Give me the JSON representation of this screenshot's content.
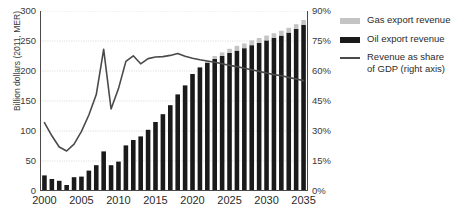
{
  "chart_data": {
    "type": "bar",
    "title": "",
    "subtitle": "",
    "xlabel": "",
    "ylabel": "Billion dollars (2011, MER)",
    "y2label": "",
    "grid": true,
    "legend_position": "right",
    "xlim": [
      1999.4,
      2035.6
    ],
    "ylim": [
      0,
      300
    ],
    "y2lim": [
      0,
      90
    ],
    "ytick_labels": [
      "300",
      "250",
      "200",
      "150",
      "100",
      "50",
      "0"
    ],
    "ytick_values": [
      300,
      250,
      200,
      150,
      100,
      50,
      0
    ],
    "y2tick_labels": [
      "90%",
      "75%",
      "60%",
      "45%",
      "30%",
      "15%",
      "0%"
    ],
    "y2tick_values": [
      90,
      75,
      60,
      45,
      30,
      15,
      0
    ],
    "xtick_labels": [
      "2000",
      "2005",
      "2010",
      "2015",
      "2020",
      "2025",
      "2030",
      "2035"
    ],
    "xtick_values": [
      2000,
      2005,
      2010,
      2015,
      2020,
      2025,
      2030,
      2035
    ],
    "categories": [
      2000,
      2001,
      2002,
      2003,
      2004,
      2005,
      2006,
      2007,
      2008,
      2009,
      2010,
      2011,
      2012,
      2013,
      2014,
      2015,
      2016,
      2017,
      2018,
      2019,
      2020,
      2021,
      2022,
      2023,
      2024,
      2025,
      2026,
      2027,
      2028,
      2029,
      2030,
      2031,
      2032,
      2033,
      2034,
      2035
    ],
    "stacked": true,
    "series": [
      {
        "name": "Oil export revenue",
        "color": "#1a1a1a",
        "values": [
          26,
          20,
          17,
          10,
          23,
          24,
          34,
          43,
          66,
          43,
          49,
          76,
          85,
          91,
          102,
          115,
          128,
          143,
          161,
          176,
          195,
          206,
          214,
          220,
          225,
          230,
          234,
          238,
          243,
          247,
          251,
          255,
          259,
          264,
          270,
          277
        ]
      },
      {
        "name": "Gas export revenue",
        "color": "#c4c4c4",
        "values": [
          0,
          0,
          0,
          0,
          0,
          0,
          0,
          0,
          0,
          0,
          0,
          0,
          0,
          0,
          0,
          0,
          0,
          0,
          0,
          0,
          0,
          0,
          3,
          5,
          6,
          7,
          8,
          8,
          8,
          8,
          8,
          8,
          8,
          8,
          8,
          8
        ]
      }
    ],
    "line_series": {
      "name": "Revenue as share of GDP (right axis)",
      "axis": "right",
      "color": "#4a4a4a",
      "x": [
        2000,
        2001,
        2002,
        2003,
        2004,
        2005,
        2006,
        2007,
        2008,
        2009,
        2010,
        2011,
        2012,
        2013,
        2014,
        2015,
        2016,
        2017,
        2018,
        2019,
        2020,
        2021,
        2022,
        2023,
        2024,
        2025,
        2026,
        2027,
        2028,
        2029,
        2030,
        2031,
        2032,
        2033,
        2034,
        2035
      ],
      "values": [
        34.2,
        27.6,
        22.0,
        20.0,
        23.4,
        29.8,
        38.0,
        48.2,
        70.8,
        41.0,
        51.2,
        64.8,
        67.6,
        63.6,
        66.2,
        67.0,
        67.2,
        67.8,
        68.8,
        67.4,
        66.4,
        65.6,
        65.0,
        64.4,
        63.6,
        62.8,
        62.2,
        61.4,
        60.6,
        59.8,
        59.0,
        58.2,
        57.6,
        56.8,
        56.0,
        55.2
      ]
    }
  },
  "legend": {
    "items": [
      {
        "label": "Gas export revenue",
        "type": "swatch",
        "color": "#c4c4c4"
      },
      {
        "label": "Oil export revenue",
        "type": "swatch",
        "color": "#1a1a1a"
      },
      {
        "label": "Revenue as share of GDP (right axis)",
        "type": "line",
        "color": "#4a4a4a"
      }
    ],
    "item_gas_label": "Gas export revenue",
    "item_oil_label": "Oil export revenue",
    "item_line_label_1": "Revenue as share",
    "item_line_label_2": "of GDP (right axis)"
  }
}
